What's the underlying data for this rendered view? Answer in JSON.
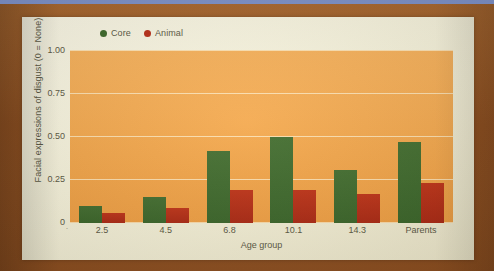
{
  "frame": {
    "top_strip_color": "#7e92c9",
    "border_color": "#9a5a28",
    "paper_color": "#f7f3dc"
  },
  "chart_data": {
    "type": "bar",
    "title": "",
    "subtitle": "",
    "xlabel": "Age group",
    "ylabel": "Facial expressions of disgust (0 = None)",
    "categories": [
      "2.5",
      "4.5",
      "6.8",
      "10.1",
      "14.3",
      "Parents"
    ],
    "series": [
      {
        "name": "Core",
        "color": "#3f6b2c",
        "values": [
          0.1,
          0.15,
          0.42,
          0.5,
          0.31,
          0.47
        ]
      },
      {
        "name": "Animal",
        "color": "#b9301a",
        "values": [
          0.06,
          0.09,
          0.19,
          0.19,
          0.17,
          0.23
        ]
      }
    ],
    "ylim": [
      0,
      1.0
    ],
    "yticks": [
      "0",
      "0.25",
      "0.50",
      "0.75",
      "1.00"
    ],
    "ytick_values": [
      0,
      0.25,
      0.5,
      0.75,
      1.0
    ],
    "grid": true,
    "legend_position": "top-left",
    "plot_background": "#f4a94f",
    "gridline_color": "#fff3d2"
  },
  "zero_mark": "."
}
